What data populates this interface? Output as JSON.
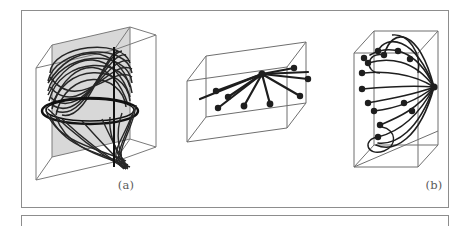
{
  "figure": {
    "kind": "scanned-book-figure",
    "background_color": "#ffffff",
    "frame_color": "#8d8d8d",
    "ink_color": "#2b2b2b",
    "wire_color": "#6f6f6f",
    "plane_fill": "#d8d8d8",
    "panels": [
      {
        "id": "a",
        "caption": "(a)",
        "description": "cube with shaded vertical plane and dense woven double-cone curve",
        "shape": "cube",
        "box": {
          "x": 35,
          "y": 38,
          "w": 128,
          "h": 132
        },
        "has_shaded_plane": true,
        "curve_style": "woven-lissajous",
        "node_count": 0
      },
      {
        "id": "b",
        "caption": "(b)",
        "description": "wide flat box with straight lines radiating from a central hub to scattered nodes",
        "shape": "wide-box",
        "box": {
          "x": 185,
          "y": 68,
          "w": 135,
          "h": 82
        },
        "has_shaded_plane": false,
        "curve_style": "straight-rays",
        "node_count": 9
      },
      {
        "id": "c",
        "caption": "(c)",
        "description": "tall box with curved arcs radiating from a right-edge hub to scattered nodes",
        "shape": "tall-box",
        "box": {
          "x": 338,
          "y": 42,
          "w": 92,
          "h": 123
        },
        "has_shaded_plane": false,
        "curve_style": "curved-arcs",
        "node_count": 12
      }
    ]
  },
  "captions": {
    "a": "(a)",
    "b": "(b)",
    "c": "(c)"
  }
}
